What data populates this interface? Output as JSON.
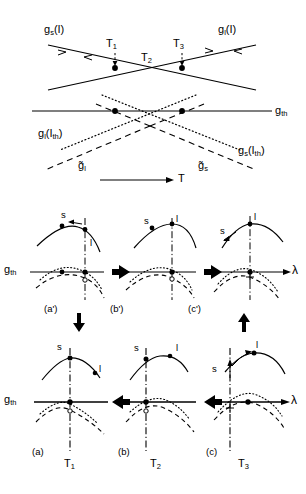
{
  "figure": {
    "background": "#ffffff",
    "ink": "#000000",
    "width": 306,
    "height": 494
  },
  "top_panel": {
    "name": "gain-vs-temperature-diagram",
    "labels": {
      "gs_I": "g",
      "gs_I_sub": "s",
      "gs_I_arg": "(I)",
      "gl_I": "g",
      "gl_I_sub": "l",
      "gl_I_arg": "(I)",
      "g_th": "g",
      "g_th_sub": "th",
      "gl_Ith": "g",
      "gl_Ith_sub": "l",
      "gl_Ith_arg": "(I",
      "gl_Ith_arg_sub": "th",
      "gl_Ith_arg_end": ")",
      "gs_Ith": "g",
      "gs_Ith_sub": "s",
      "gs_Ith_arg": "(I",
      "gs_Ith_arg_sub": "th",
      "gs_Ith_arg_end": ")",
      "gbar_l": "g̃",
      "gbar_l_sub": "l",
      "gbar_s": "g̃",
      "gbar_s_sub": "s",
      "T1": "T",
      "T1_sub": "1",
      "T2": "T",
      "T2_sub": "2",
      "T3": "T",
      "T3_sub": "3",
      "axis_T": "T"
    },
    "markers": [
      {
        "label": "T1",
        "x": 115,
        "y": 68
      },
      {
        "label": "T3",
        "x": 182,
        "y": 68
      },
      {
        "label": "T1-threshold",
        "x": 115,
        "y": 111
      },
      {
        "label": "T3-threshold",
        "x": 182,
        "y": 111
      }
    ],
    "axis_arrow": "T"
  },
  "middle_row": {
    "name": "upper-panel-row",
    "panels": [
      {
        "id": "a-prime",
        "caption": "(a')",
        "s_label": "s",
        "l_label": "l",
        "s_on_left_of_peak": true,
        "l_marker_right_low": true,
        "arrow_on_s": "left",
        "gain_label": "g",
        "gain_label_sub": "th"
      },
      {
        "id": "b-prime",
        "caption": "(b')",
        "s_label": "s",
        "l_label": "l",
        "s_on_left_of_peak": true,
        "l_marker_right_low": false
      },
      {
        "id": "c-prime",
        "caption": "(c')",
        "s_label": "s",
        "l_label": "l",
        "s_on_left_of_peak": true,
        "l_marker_right_low": false,
        "axis_label": "λ"
      }
    ],
    "flow_arrows": [
      "left",
      "left"
    ],
    "axis_label": "λ",
    "gain_label": "g",
    "gain_label_sub": "th"
  },
  "bottom_row": {
    "name": "lower-panel-row",
    "panels": [
      {
        "id": "a",
        "caption": "(a)",
        "temperature": "T",
        "temperature_sub": "1",
        "s_label": "s",
        "l_label": "l"
      },
      {
        "id": "b",
        "caption": "(b)",
        "temperature": "T",
        "temperature_sub": "2",
        "s_label": "s",
        "l_label": "l"
      },
      {
        "id": "c",
        "caption": "(c)",
        "temperature": "T",
        "temperature_sub": "3",
        "s_label": "s",
        "l_label": "l"
      }
    ],
    "flow_arrows": [
      "right",
      "right"
    ],
    "axis_label": "λ",
    "gain_label": "g",
    "gain_label_sub": "th"
  },
  "column_arrows": {
    "left": "down",
    "right": "up"
  }
}
